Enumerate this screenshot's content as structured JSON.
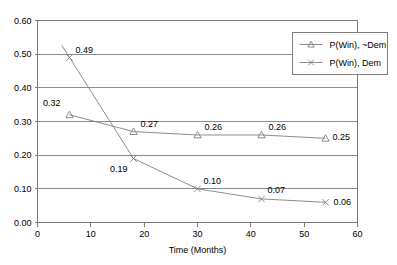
{
  "chart_data": {
    "type": "line",
    "title": "",
    "xlabel": "Time (Months)",
    "ylabel": "",
    "xlim": [
      0,
      60
    ],
    "ylim": [
      0.0,
      0.6
    ],
    "xticks": [
      "0",
      "10",
      "20",
      "30",
      "40",
      "50",
      "60"
    ],
    "xtick_values": [
      0,
      10,
      20,
      30,
      40,
      50,
      60
    ],
    "yticks": [
      "0.00",
      "0.10",
      "0.20",
      "0.30",
      "0.40",
      "0.50",
      "0.60"
    ],
    "ytick_values": [
      0.0,
      0.1,
      0.2,
      0.3,
      0.4,
      0.5,
      0.6
    ],
    "grid": "horizontal",
    "legend_position": "top-right-inside",
    "x": [
      6,
      18,
      30,
      42,
      54
    ],
    "series": [
      {
        "name": "P(Win), ~Dem",
        "marker": "triangle",
        "color": "#808080",
        "values": [
          0.32,
          0.27,
          0.26,
          0.26,
          0.25
        ],
        "labels": [
          "0.32",
          "0.27",
          "0.26",
          "0.26",
          "0.25"
        ],
        "label_offsets": [
          {
            "dx": -9,
            "dy": -9
          },
          {
            "dx": 7,
            "dy": -5
          },
          {
            "dx": 7,
            "dy": -5
          },
          {
            "dx": 7,
            "dy": -5
          },
          {
            "dx": 7,
            "dy": 2
          }
        ]
      },
      {
        "name": "P(Win), Dem",
        "marker": "x",
        "color": "#808080",
        "values": [
          0.49,
          0.19,
          0.1,
          0.07,
          0.06
        ],
        "labels": [
          "0.49",
          "0.19",
          "0.10",
          "0.07",
          "0.06"
        ],
        "label_offsets": [
          {
            "dx": 6,
            "dy": -5
          },
          {
            "dx": -6,
            "dy": 13
          },
          {
            "dx": 6,
            "dy": -5
          },
          {
            "dx": 6,
            "dy": -6
          },
          {
            "dx": 8,
            "dy": 3
          }
        ]
      }
    ]
  },
  "legend": {
    "entries": [
      {
        "label": "P(Win), ~Dem",
        "marker": "triangle"
      },
      {
        "label": "P(Win), Dem",
        "marker": "x"
      }
    ]
  },
  "colors": {
    "line": "#808080",
    "grid": "#808080",
    "axis": "#7a7a7a",
    "text": "#000000",
    "background": "#ffffff",
    "legend_border": "#808080"
  }
}
